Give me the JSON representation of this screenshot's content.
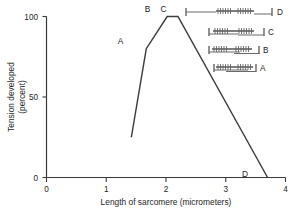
{
  "chart_data": {
    "type": "line",
    "title": "",
    "xlabel": "Length of sarcomere (micrometers)",
    "ylabel_line1": "Tension developed",
    "ylabel_line2": "(percent)",
    "xlim": [
      0,
      4
    ],
    "ylim": [
      0,
      100
    ],
    "xticks": [
      0,
      1,
      2,
      3,
      4
    ],
    "xtick_labels": [
      "0",
      "1",
      "2",
      "3",
      "4"
    ],
    "yticks": [
      0,
      50,
      100
    ],
    "ytick_labels": [
      "0",
      "50",
      "100"
    ],
    "grid": false,
    "legend": "none",
    "x": [
      1.42,
      1.67,
      2.02,
      2.2,
      3.7
    ],
    "values": [
      25,
      80,
      100,
      100,
      0
    ],
    "series": [
      {
        "name": "Tension developed",
        "x": [
          1.42,
          1.67,
          2.02,
          2.2,
          3.7
        ],
        "values": [
          25,
          80,
          100,
          100,
          0
        ]
      }
    ],
    "annotations": [
      {
        "label": "A",
        "x": 1.67,
        "y": 80
      },
      {
        "label": "B",
        "x": 2.02,
        "y": 100
      },
      {
        "label": "C",
        "x": 2.2,
        "y": 100
      },
      {
        "label": "D",
        "x": 3.7,
        "y": 0
      }
    ]
  },
  "axes": {
    "x_title": "Length of sarcomere (micrometers)",
    "y_title_line1": "Tension developed",
    "y_title_line2": "(percent)",
    "x_tick_labels": [
      "0",
      "1",
      "2",
      "3",
      "4"
    ],
    "y_tick_labels": [
      "100",
      "50",
      "0"
    ]
  },
  "curve_labels": {
    "a": "A",
    "b": "B",
    "c": "C",
    "d": "D"
  },
  "sarcomere_diagrams": [
    {
      "label": "D",
      "state": "overstretched-no-overlap",
      "sarcomere_length_um": 3.7
    },
    {
      "label": "C",
      "state": "optimal-long-full-bridge-overlap",
      "sarcomere_length_um": 2.2
    },
    {
      "label": "B",
      "state": "optimal-short-full-bridge-overlap",
      "sarcomere_length_um": 2.02
    },
    {
      "label": "A",
      "state": "shortened-thin-filament-overlap",
      "sarcomere_length_um": 1.67
    }
  ],
  "colors": {
    "line": "#3d3d3d",
    "axis": "#3a3a3a",
    "text": "#262626",
    "filament": "#5e5e5e",
    "background": "#ffffff"
  }
}
